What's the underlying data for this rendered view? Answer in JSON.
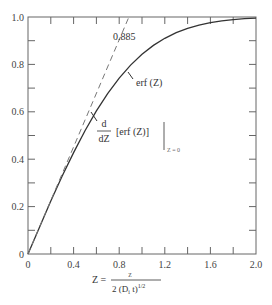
{
  "chart_data": {
    "type": "line",
    "title": "",
    "xlabel": "Z = z / (2 (D_i t)^{1/2})",
    "ylabel": "",
    "xlim": [
      0,
      2.0
    ],
    "ylim": [
      0,
      1.0
    ],
    "grid": false,
    "x_ticks": [
      "0",
      "0.4",
      "0.8",
      "1.2",
      "1.6",
      "2.0"
    ],
    "y_ticks": [
      "0",
      "0.2",
      "0.4",
      "0.6",
      "0.8",
      "1.0"
    ],
    "series": [
      {
        "name": "erf (Z)",
        "style": "solid",
        "x": [
          0,
          0.1,
          0.2,
          0.3,
          0.4,
          0.5,
          0.6,
          0.7,
          0.8,
          0.9,
          1.0,
          1.1,
          1.2,
          1.3,
          1.4,
          1.5,
          1.6,
          1.7,
          1.8,
          1.9,
          2.0
        ],
        "values": [
          0,
          0.112,
          0.223,
          0.329,
          0.428,
          0.52,
          0.604,
          0.678,
          0.742,
          0.797,
          0.843,
          0.88,
          0.91,
          0.934,
          0.952,
          0.966,
          0.976,
          0.984,
          0.989,
          0.993,
          0.995
        ]
      },
      {
        "name": "d/dZ [erf (Z)] at Z = 0 (tangent)",
        "style": "dashed",
        "x": [
          0,
          0.885
        ],
        "values": [
          0,
          1.0
        ]
      }
    ],
    "annotations": [
      {
        "text": "0.885",
        "x": 0.885,
        "y": 1.0
      },
      {
        "text": "erf (Z)",
        "x": 0.88,
        "y": 0.78
      },
      {
        "text": "d/dZ [erf (Z)] |_{Z = 0}",
        "x": 0.55,
        "y": 0.6
      }
    ]
  },
  "labels": {
    "x_ticks": [
      "0",
      "0.4",
      "0.8",
      "1.2",
      "1.6",
      "2.0"
    ],
    "y_ticks": [
      "0",
      "0.2",
      "0.4",
      "0.6",
      "0.8",
      "1.0"
    ],
    "annot_885": "0.885",
    "annot_erf": "erf (Z)",
    "annot_deriv_d": "d",
    "annot_deriv_dz": "dZ",
    "annot_deriv_body": "[erf (Z)]",
    "annot_deriv_sub": "Z = 0",
    "xlabel_lhs": "Z =",
    "xlabel_num": "z",
    "xlabel_den": "2 (D",
    "xlabel_den_sub": "i",
    "xlabel_den_tail": " t)",
    "xlabel_den_sup": "1/2"
  }
}
